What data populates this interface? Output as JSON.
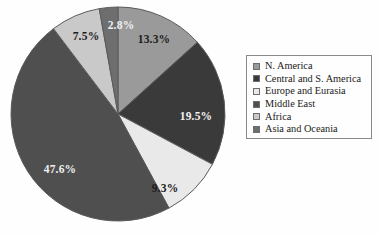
{
  "chart_data": {
    "type": "pie",
    "title": "",
    "subtitle": "",
    "xlabel": "",
    "ylabel": "",
    "units": "percent",
    "legend_position": "right",
    "grid": false,
    "start_angle_deg": 0,
    "direction": "clockwise",
    "categories": [
      "N. America",
      "Central and S. America",
      "Europe and Eurasia",
      "Middle East",
      "Africa",
      "Asia and Oceania"
    ],
    "values": [
      13.3,
      19.5,
      9.3,
      47.6,
      7.5,
      2.8
    ],
    "labels": [
      "13.3%",
      "19.5%",
      "9.3%",
      "47.6%",
      "7.5%",
      "2.8%"
    ],
    "colors": [
      "#9a9a9a",
      "#3a3a3a",
      "#e9e9e9",
      "#4f4f4f",
      "#c9c9c9",
      "#6e6e6e"
    ],
    "label_colors": [
      "#1d1d1d",
      "#f2f2f2",
      "#1d1d1d",
      "#efefef",
      "#1d1d1d",
      "#efefef"
    ],
    "slices": [
      {
        "name": "N. America",
        "value": 13.3,
        "label": "13.3%",
        "color": "#9a9a9a",
        "label_color": "#1d1d1d",
        "label_x": 144,
        "label_y": 34
      },
      {
        "name": "Central and S. America",
        "value": 19.5,
        "label": "19.5%",
        "color": "#3a3a3a",
        "label_color": "#f2f2f2",
        "label_x": 186,
        "label_y": 111
      },
      {
        "name": "Europe and Eurasia",
        "value": 9.3,
        "label": "9.3%",
        "color": "#e9e9e9",
        "label_color": "#1d1d1d",
        "label_x": 155,
        "label_y": 183
      },
      {
        "name": "Middle East",
        "value": 47.6,
        "label": "47.6%",
        "color": "#4f4f4f",
        "label_color": "#efefef",
        "label_x": 50,
        "label_y": 164
      },
      {
        "name": "Africa",
        "value": 7.5,
        "label": "7.5%",
        "color": "#c9c9c9",
        "label_color": "#1d1d1d",
        "label_x": 76,
        "label_y": 31
      },
      {
        "name": "Asia and Oceania",
        "value": 2.8,
        "label": "2.8%",
        "color": "#6e6e6e",
        "label_color": "#efefef",
        "label_x": 111,
        "label_y": 20
      }
    ],
    "geometry": {
      "cx": 108,
      "cy": 108,
      "r": 107
    },
    "outline_color": "#5a5a5a"
  },
  "legend": {
    "border_color": "#8a8a8a",
    "items": [
      {
        "label": "N. America",
        "color": "#9a9a9a"
      },
      {
        "label": "Central and S. America",
        "color": "#3a3a3a"
      },
      {
        "label": "Europe and Eurasia",
        "color": "#e9e9e9"
      },
      {
        "label": "Middle East",
        "color": "#4f4f4f"
      },
      {
        "label": "Africa",
        "color": "#c9c9c9"
      },
      {
        "label": "Asia and Oceania",
        "color": "#6e6e6e"
      }
    ]
  }
}
